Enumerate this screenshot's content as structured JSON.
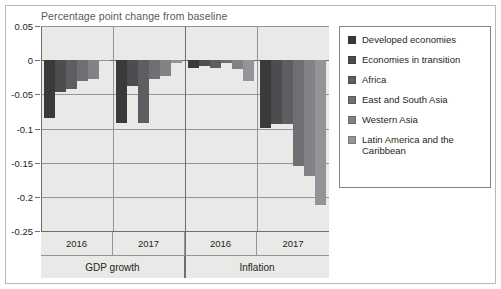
{
  "chart_data": {
    "type": "bar",
    "title": "Percentage point change from baseline",
    "xlabel": "",
    "ylabel": "",
    "ylim": [
      -0.25,
      0.05
    ],
    "yticks": [
      0.05,
      0,
      -0.05,
      -0.1,
      -0.15,
      -0.2,
      -0.25
    ],
    "ytick_labels": [
      "0.05",
      "0",
      "-0.05",
      "-0.1",
      "-0.15",
      "-0.2",
      "-0.25"
    ],
    "grid": true,
    "legend_position": "right",
    "group_labels": [
      "GDP growth",
      "Inflation"
    ],
    "categories": [
      "2016",
      "2017",
      "2016",
      "2017"
    ],
    "series": [
      {
        "name": "Developed economies",
        "color": "#3a3a3c",
        "values": [
          -0.085,
          -0.092,
          -0.012,
          -0.1
        ]
      },
      {
        "name": "Economies in transition",
        "color": "#4d4d50",
        "values": [
          -0.046,
          -0.038,
          -0.008,
          -0.093
        ]
      },
      {
        "name": "Africa",
        "color": "#5d5e61",
        "values": [
          -0.042,
          -0.092,
          -0.012,
          -0.094
        ]
      },
      {
        "name": "East and South Asia",
        "color": "#6f7073",
        "values": [
          -0.03,
          -0.028,
          -0.004,
          -0.155
        ]
      },
      {
        "name": "Western Asia",
        "color": "#808285",
        "values": [
          -0.028,
          -0.023,
          -0.013,
          -0.17
        ]
      },
      {
        "name": "Latin America and the Caribbean",
        "color": "#929497",
        "values": [
          -0.001,
          -0.004,
          -0.03,
          -0.212
        ]
      }
    ]
  },
  "legend": {
    "items": [
      {
        "label": "Developed economies"
      },
      {
        "label": "Economies in transition"
      },
      {
        "label": "Africa"
      },
      {
        "label": "East and South Asia"
      },
      {
        "label": "Western Asia"
      },
      {
        "label": "Latin America and the Caribbean"
      }
    ]
  },
  "axis": {
    "x_years": [
      "2016",
      "2017",
      "2016",
      "2017"
    ],
    "x_groups": [
      "GDP growth",
      "Inflation"
    ]
  }
}
